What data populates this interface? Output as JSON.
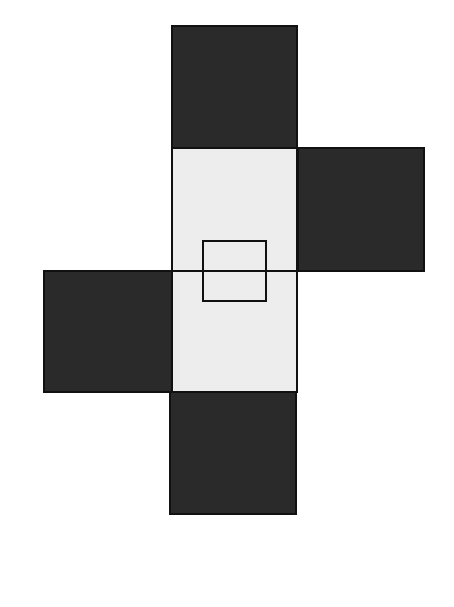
{
  "diagram": {
    "colors": {
      "dark": "#2a2a2a",
      "light": "#ededed",
      "stroke": "#111111",
      "background": "#ffffff"
    },
    "squares": [
      {
        "id": "top",
        "fill": "dark",
        "x": 171,
        "y": 25,
        "w": 127,
        "h": 124
      },
      {
        "id": "center-upper",
        "fill": "light",
        "x": 171,
        "y": 148,
        "w": 127,
        "h": 123
      },
      {
        "id": "right",
        "fill": "dark",
        "x": 297,
        "y": 147,
        "w": 128,
        "h": 125
      },
      {
        "id": "left",
        "fill": "dark",
        "x": 43,
        "y": 270,
        "w": 129,
        "h": 123
      },
      {
        "id": "center-lower",
        "fill": "light",
        "x": 171,
        "y": 270,
        "w": 127,
        "h": 123
      },
      {
        "id": "bottom",
        "fill": "dark",
        "x": 169,
        "y": 392,
        "w": 128,
        "h": 123
      }
    ],
    "inner_rectangle": {
      "x": 202,
      "y": 240,
      "w": 65,
      "h": 62
    }
  }
}
